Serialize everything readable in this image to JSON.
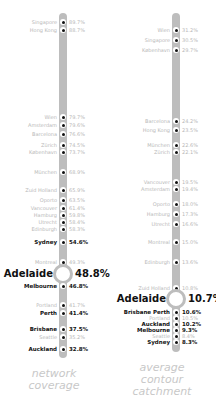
{
  "chart_data": [
    {
      "type": "dot-strip",
      "title": "network coverage",
      "caption_lines": [
        "network",
        "coverage"
      ],
      "highlight": "Adelaide",
      "points": [
        {
          "city": "Singapore",
          "value": "89.7%",
          "y": 22,
          "style": "faint"
        },
        {
          "city": "Hong Kong",
          "value": "88.7%",
          "y": 30,
          "style": "faint"
        },
        {
          "city": "Wien",
          "value": "79.7%",
          "y": 117,
          "style": "faint"
        },
        {
          "city": "Amsterdam",
          "value": "79.6%",
          "y": 125,
          "style": "faint"
        },
        {
          "city": "Barcelona",
          "value": "76.6%",
          "y": 134,
          "style": "faint"
        },
        {
          "city": "Zürich",
          "value": "74.5%",
          "y": 145,
          "style": "faint"
        },
        {
          "city": "København",
          "value": "73.7%",
          "y": 152,
          "style": "faint"
        },
        {
          "city": "München",
          "value": "68.9%",
          "y": 172,
          "style": "faint"
        },
        {
          "city": "Zuid Holland",
          "value": "65.9%",
          "y": 190,
          "style": "faint"
        },
        {
          "city": "Oporto",
          "value": "63.5%",
          "y": 200,
          "style": "faint"
        },
        {
          "city": "Vancouver",
          "value": "61.4%",
          "y": 208,
          "style": "faint"
        },
        {
          "city": "Hamburg",
          "value": "59.8%",
          "y": 215,
          "style": "faint"
        },
        {
          "city": "Utrecht",
          "value": "58.4%",
          "y": 222,
          "style": "faint"
        },
        {
          "city": "Edinburgh",
          "value": "58.3%",
          "y": 229,
          "style": "faint"
        },
        {
          "city": "Sydney",
          "value": "54.6%",
          "y": 242,
          "style": "bold"
        },
        {
          "city": "Montreal",
          "value": "49.3%",
          "y": 262,
          "style": "faint"
        },
        {
          "city": "Adelaide",
          "value": "48.8%",
          "y": 274,
          "style": "hero"
        },
        {
          "city": "Melbourne",
          "value": "46.8%",
          "y": 286,
          "style": "bold"
        },
        {
          "city": "Portland",
          "value": "41.7%",
          "y": 305,
          "style": "faint"
        },
        {
          "city": "Perth",
          "value": "41.4%",
          "y": 313,
          "style": "bold"
        },
        {
          "city": "Brisbane",
          "value": "37.5%",
          "y": 329,
          "style": "bold"
        },
        {
          "city": "Seattle",
          "value": "35.2%",
          "y": 337,
          "style": "faint"
        },
        {
          "city": "Auckland",
          "value": "32.8%",
          "y": 349,
          "style": "bold"
        }
      ],
      "bar_top": 13,
      "bar_bottom": 358
    },
    {
      "type": "dot-strip",
      "title": "average contour catchment",
      "caption_lines": [
        "average",
        "contour",
        "catchment"
      ],
      "highlight": "Adelaide",
      "points": [
        {
          "city": "Wien",
          "value": "31.2%",
          "y": 30,
          "style": "faint"
        },
        {
          "city": "Singapore",
          "value": "30.5%",
          "y": 40,
          "style": "faint"
        },
        {
          "city": "København",
          "value": "29.7%",
          "y": 50,
          "style": "faint"
        },
        {
          "city": "Barcelona",
          "value": "24.2%",
          "y": 121,
          "style": "faint"
        },
        {
          "city": "Hong Kong",
          "value": "23.5%",
          "y": 130,
          "style": "faint"
        },
        {
          "city": "München",
          "value": "22.6%",
          "y": 145,
          "style": "faint"
        },
        {
          "city": "Zürich",
          "value": "22.1%",
          "y": 152,
          "style": "faint"
        },
        {
          "city": "Vancouver",
          "value": "19.5%",
          "y": 182,
          "style": "faint"
        },
        {
          "city": "Amsterdam",
          "value": "19.4%",
          "y": 189,
          "style": "faint"
        },
        {
          "city": "Oporto",
          "value": "18.0%",
          "y": 204,
          "style": "faint"
        },
        {
          "city": "Hamburg",
          "value": "17.3%",
          "y": 214,
          "style": "faint"
        },
        {
          "city": "Utrecht",
          "value": "16.6%",
          "y": 224,
          "style": "faint"
        },
        {
          "city": "Montreal",
          "value": "15.0%",
          "y": 242,
          "style": "faint"
        },
        {
          "city": "Edinburgh",
          "value": "13.6%",
          "y": 262,
          "style": "faint"
        },
        {
          "city": "Zuid Holland",
          "value": "10.8%",
          "y": 288,
          "style": "faint"
        },
        {
          "city": "Adelaide",
          "value": "10.7%",
          "y": 299,
          "style": "hero"
        },
        {
          "city": "Brisbane Perth",
          "value": "10.6%",
          "y": 312,
          "style": "bold"
        },
        {
          "city": "Portland",
          "value": "10.5%",
          "y": 318,
          "style": "faint"
        },
        {
          "city": "Auckland",
          "value": "10.2%",
          "y": 324,
          "style": "bold"
        },
        {
          "city": "Melbourne",
          "value": "9.3%",
          "y": 330,
          "style": "bold"
        },
        {
          "city": "Seattle",
          "value": "8.4%",
          "y": 336,
          "style": "faint"
        },
        {
          "city": "Sydney",
          "value": "8.3%",
          "y": 342,
          "style": "bold"
        }
      ],
      "bar_top": 13,
      "bar_bottom": 352
    }
  ]
}
